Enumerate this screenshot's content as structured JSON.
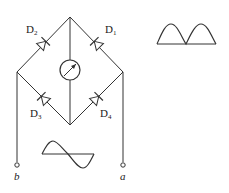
{
  "diagram": {
    "type": "bridge-rectifier-circuit",
    "diodes": [
      {
        "id": "D1",
        "letter": "D",
        "sub": "1"
      },
      {
        "id": "D2",
        "letter": "D",
        "sub": "2"
      },
      {
        "id": "D3",
        "letter": "D",
        "sub": "3"
      },
      {
        "id": "D4",
        "letter": "D",
        "sub": "4"
      }
    ],
    "meter": "galvanometer",
    "terminals": {
      "left": "b",
      "right": "a"
    },
    "input_waveform": "sine",
    "output_waveform": "full-wave-rectified"
  },
  "colors": {
    "line": "#333333",
    "background": "#ffffff"
  }
}
